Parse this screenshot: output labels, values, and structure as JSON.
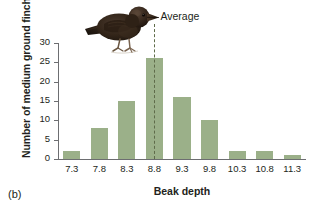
{
  "panel": {
    "letter": "(b)"
  },
  "chart_data": {
    "type": "bar",
    "title": "",
    "xlabel": "Beak depth",
    "ylabel": "Number of medium ground finches",
    "categories": [
      "7.3",
      "7.8",
      "8.3",
      "8.8",
      "9.3",
      "9.8",
      "10.3",
      "10.8",
      "11.3"
    ],
    "values": [
      2,
      8,
      15,
      26,
      16,
      10,
      2,
      2,
      1
    ],
    "ylim": [
      0,
      30
    ],
    "yticks": [
      0,
      5,
      10,
      15,
      20,
      25,
      30
    ],
    "ytick_labels": [
      "0",
      "5",
      "10",
      "15",
      "20",
      "25",
      "30"
    ],
    "grid": false,
    "legend": null,
    "bar_color": "#9bb089",
    "annotations": [
      {
        "label": "Average",
        "type": "vline",
        "category": "8.8",
        "style": "dashed",
        "color": "#5f6b4a"
      }
    ]
  },
  "illustration": {
    "name": "medium-ground-finch",
    "alt": "Medium ground finch perched"
  }
}
